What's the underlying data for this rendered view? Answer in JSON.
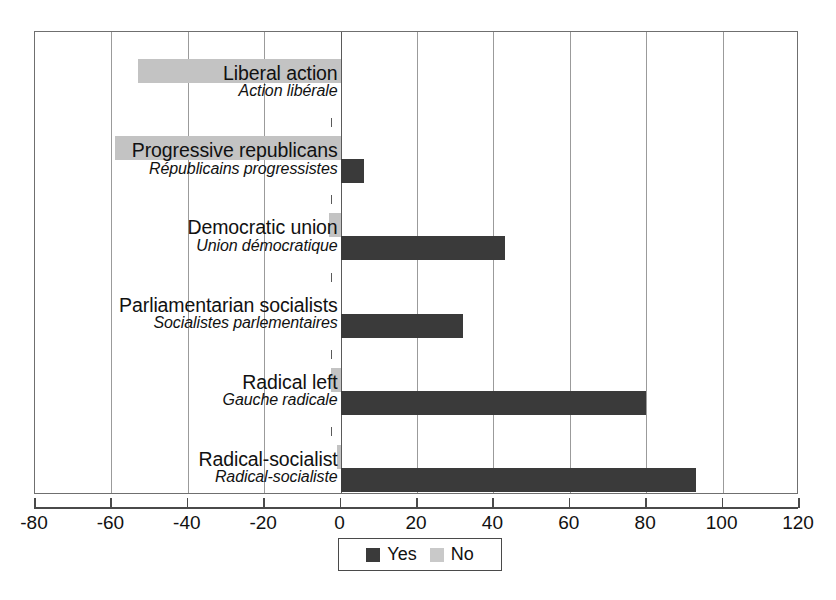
{
  "chart_data": {
    "type": "bar",
    "orientation": "horizontal",
    "title": "",
    "xlabel": "",
    "ylabel": "",
    "xlim": [
      -80,
      120
    ],
    "xticks": [
      -80,
      -60,
      -40,
      -20,
      0,
      20,
      40,
      60,
      80,
      100,
      120
    ],
    "xtick_labels": [
      "-80",
      "-60",
      "-40",
      "-20",
      "0",
      "20",
      "40",
      "60",
      "80",
      "100",
      "120"
    ],
    "grid": true,
    "grid_axis": "x",
    "legend": {
      "position": "bottom-center",
      "entries": [
        {
          "label": "Yes",
          "color": "#3a3a3a"
        },
        {
          "label": "No",
          "color": "#c9c9c9"
        }
      ]
    },
    "categories": [
      {
        "label_en": "Liberal action",
        "label_fr": "Action libérale"
      },
      {
        "label_en": "Progressive republicans",
        "label_fr": "Républicains progressistes"
      },
      {
        "label_en": "Democratic union",
        "label_fr": "Union démocratique"
      },
      {
        "label_en": "Parliamentarian socialists",
        "label_fr": "Socialistes parlementaires"
      },
      {
        "label_en": "Radical left",
        "label_fr": "Gauche radicale"
      },
      {
        "label_en": "Radical-socialist",
        "label_fr": "Radical-socialiste"
      }
    ],
    "series": [
      {
        "name": "Yes",
        "color": "#3a3a3a",
        "values": [
          0,
          6,
          43,
          32,
          80,
          93
        ]
      },
      {
        "name": "No",
        "color": "#c3c3c3",
        "values": [
          -53,
          -59,
          -3,
          0,
          -2.5,
          -1
        ]
      }
    ]
  },
  "colors": {
    "yes": "#3a3a3a",
    "no": "#c3c3c3",
    "frame": "#6f6f6f",
    "grid": "#9b9b9b",
    "axis": "#4a4a4a",
    "background": "#ffffff"
  }
}
